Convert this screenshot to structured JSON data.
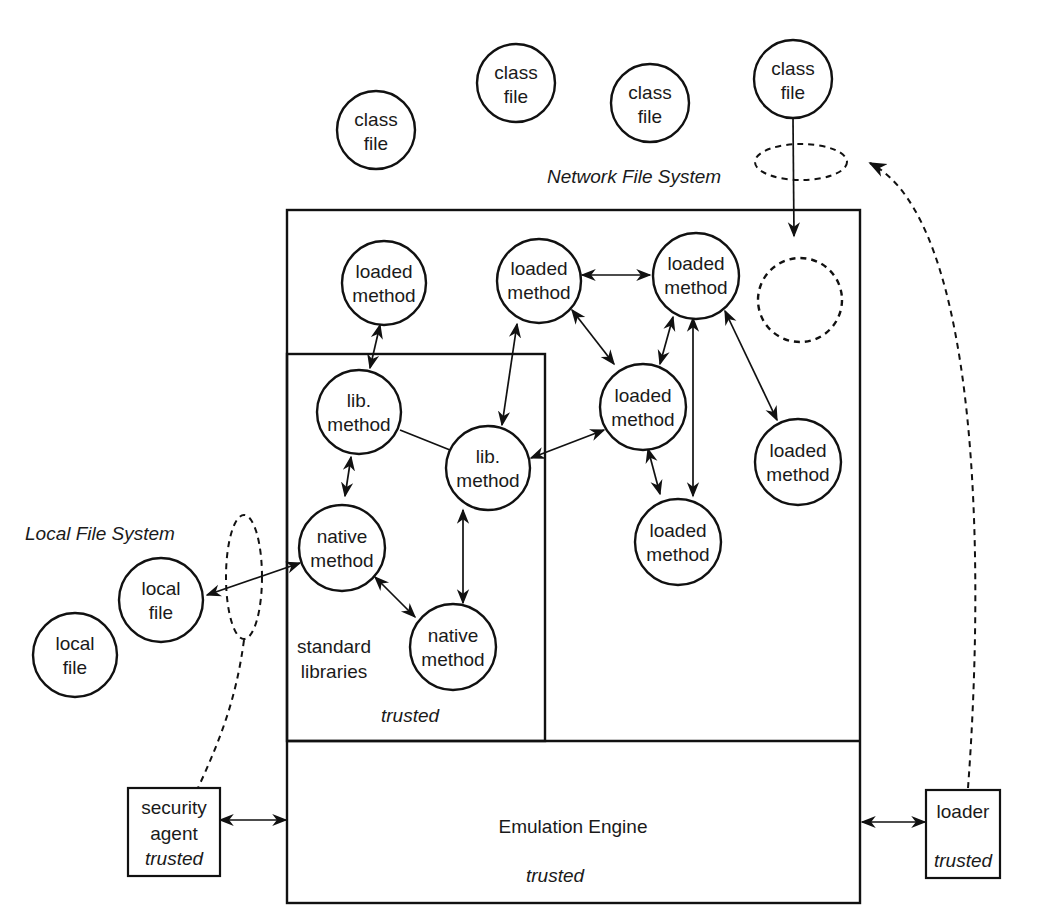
{
  "diagram": {
    "regions": {
      "network_fs": "Network File System",
      "local_fs": "Local File System",
      "standard_libraries_line1": "standard",
      "standard_libraries_line2": "libraries",
      "std_trusted": "trusted",
      "engine_label": "Emulation Engine",
      "engine_trusted": "trusted"
    },
    "class_files": [
      {
        "l1": "class",
        "l2": "file"
      },
      {
        "l1": "class",
        "l2": "file"
      },
      {
        "l1": "class",
        "l2": "file"
      },
      {
        "l1": "class",
        "l2": "file"
      }
    ],
    "loaded_methods": [
      {
        "l1": "loaded",
        "l2": "method"
      },
      {
        "l1": "loaded",
        "l2": "method"
      },
      {
        "l1": "loaded",
        "l2": "method"
      },
      {
        "l1": "loaded",
        "l2": "method"
      },
      {
        "l1": "loaded",
        "l2": "method"
      },
      {
        "l1": "loaded",
        "l2": "method"
      }
    ],
    "lib_methods": [
      {
        "l1": "lib.",
        "l2": "method"
      },
      {
        "l1": "lib.",
        "l2": "method"
      }
    ],
    "native_methods": [
      {
        "l1": "native",
        "l2": "method"
      },
      {
        "l1": "native",
        "l2": "method"
      }
    ],
    "local_files": [
      {
        "l1": "local",
        "l2": "file"
      },
      {
        "l1": "local",
        "l2": "file"
      }
    ],
    "security_agent": {
      "l1": "security",
      "l2": "agent",
      "l3": "trusted"
    },
    "loader": {
      "l1": "loader",
      "l2": "trusted"
    }
  }
}
